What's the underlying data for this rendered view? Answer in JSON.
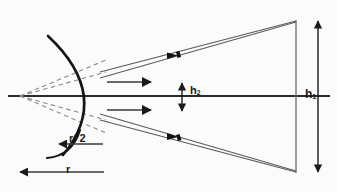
{
  "figure": {
    "background_color": "#fbfbfb",
    "line_color": "#1a1a1a",
    "ray_color": "#555555",
    "dashed_color": "#777777",
    "width": 337,
    "height": 192
  },
  "labels": {
    "h1_base": "h",
    "h1_sub": "1",
    "h2_base": "h",
    "h2_sub": "2",
    "radius_half": "r/ 2",
    "radius": "r"
  },
  "diagram_data": {
    "type": "optics-ray-diagram",
    "optical_axis": {
      "y": 96,
      "x_start": 8,
      "x_end": 330
    },
    "mirror": {
      "shape": "convex-arc",
      "vertex_x": 103,
      "top_y": 36,
      "bottom_y": 154,
      "bulge": "right"
    },
    "focal_point": {
      "x": 22,
      "y": 96,
      "label": "virtual focus"
    },
    "image_plane": {
      "x": 296,
      "y_top": 21,
      "y_bottom": 172
    },
    "dimension_h1": {
      "x": 318,
      "y_top": 21,
      "y_bottom": 172,
      "arrows": "both"
    },
    "dimension_h2": {
      "x": 182,
      "y_top": 84,
      "y_bottom": 110,
      "arrows": "both"
    },
    "dimension_r": {
      "y": 172,
      "x_left": 20,
      "x_right": 104,
      "arrow": "left"
    },
    "dimension_r_half": {
      "y": 144,
      "x_left": 60,
      "x_right": 112,
      "arrow": "left"
    },
    "incident_arrows": [
      {
        "y": 82,
        "x_start": 108,
        "x_end": 152,
        "direction": "right"
      },
      {
        "y": 110,
        "x_start": 108,
        "x_end": 152,
        "direction": "right"
      }
    ],
    "ray_bundles": [
      {
        "name": "upper-reflected-bundle",
        "from_x": 101,
        "from_y": 75,
        "to_x": 296,
        "to_y": 21
      },
      {
        "name": "lower-reflected-bundle",
        "from_x": 101,
        "from_y": 117,
        "to_x": 296,
        "to_y": 172
      }
    ],
    "dashed_rays": [
      {
        "from_x": 22,
        "from_y": 96,
        "to_x": 104,
        "to_y": 64
      },
      {
        "from_x": 22,
        "from_y": 96,
        "to_x": 104,
        "to_y": 73
      },
      {
        "from_x": 22,
        "from_y": 96,
        "to_x": 104,
        "to_y": 120
      },
      {
        "from_x": 22,
        "from_y": 96,
        "to_x": 104,
        "to_y": 129
      }
    ]
  }
}
